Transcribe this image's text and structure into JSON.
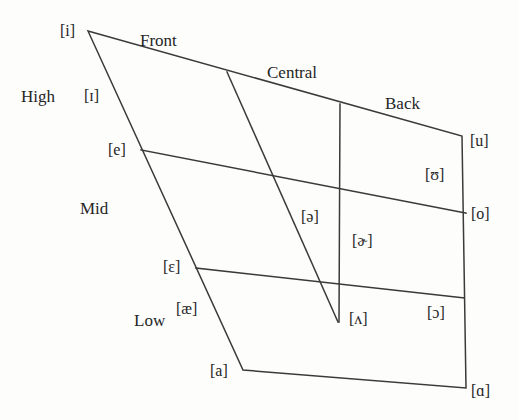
{
  "chart_data": {
    "type": "diagram",
    "subtitle": "",
    "axis_labels": {
      "height": [
        "High",
        "Mid",
        "Low"
      ],
      "backness": [
        "Front",
        "Central",
        "Back"
      ]
    },
    "vowels": [
      {
        "symbol": "[i]",
        "height": "High",
        "backness": "Front",
        "x": 60,
        "y": 23
      },
      {
        "symbol": "[ɪ]",
        "height": "High",
        "backness": "Front",
        "x": 84,
        "y": 88
      },
      {
        "symbol": "[e]",
        "height": "Mid",
        "backness": "Front",
        "x": 108,
        "y": 142
      },
      {
        "symbol": "[ɛ]",
        "height": "Mid",
        "backness": "Front",
        "x": 163,
        "y": 259
      },
      {
        "symbol": "[æ]",
        "height": "Low",
        "backness": "Front",
        "x": 176,
        "y": 301
      },
      {
        "symbol": "[a]",
        "height": "Low",
        "backness": "Front",
        "x": 210,
        "y": 363
      },
      {
        "symbol": "[ə]",
        "height": "Mid",
        "backness": "Central",
        "x": 301,
        "y": 209
      },
      {
        "symbol": "[ɚ]",
        "height": "Mid",
        "backness": "Central",
        "x": 352,
        "y": 233
      },
      {
        "symbol": "[ʌ]",
        "height": "Low",
        "backness": "Central",
        "x": 349,
        "y": 311
      },
      {
        "symbol": "[u]",
        "height": "High",
        "backness": "Back",
        "x": 470,
        "y": 133
      },
      {
        "symbol": "[ʊ]",
        "height": "High",
        "backness": "Back",
        "x": 425,
        "y": 167
      },
      {
        "symbol": "[o]",
        "height": "Mid",
        "backness": "Back",
        "x": 471,
        "y": 206
      },
      {
        "symbol": "[ɔ]",
        "height": "Low",
        "backness": "Back",
        "x": 427,
        "y": 305
      },
      {
        "symbol": "[ɑ]",
        "height": "Low",
        "backness": "Back",
        "x": 471,
        "y": 383
      }
    ],
    "region_labels": [
      {
        "text": "Front",
        "x": 140,
        "y": 32
      },
      {
        "text": "Central",
        "x": 267,
        "y": 64
      },
      {
        "text": "Back",
        "x": 385,
        "y": 95
      },
      {
        "text": "High",
        "x": 21,
        "y": 88
      },
      {
        "text": "Mid",
        "x": 80,
        "y": 200
      },
      {
        "text": "Low",
        "x": 134,
        "y": 312
      }
    ],
    "geometry": {
      "outline": "88,31 462,136 466,388 243,370",
      "internal_lines": [
        {
          "name": "mid-upper-horizontal",
          "points": "141,150 466,213"
        },
        {
          "name": "mid-lower-horizontal",
          "points": "196,268 464,298"
        },
        {
          "name": "central-diagonal",
          "points": "227,72 338,322"
        },
        {
          "name": "back-vertical",
          "points": "340,104 339,322"
        }
      ]
    },
    "style": {
      "line_color": "#3a3a3a",
      "background": "#fdfdfc",
      "text_color": "#252525"
    }
  }
}
